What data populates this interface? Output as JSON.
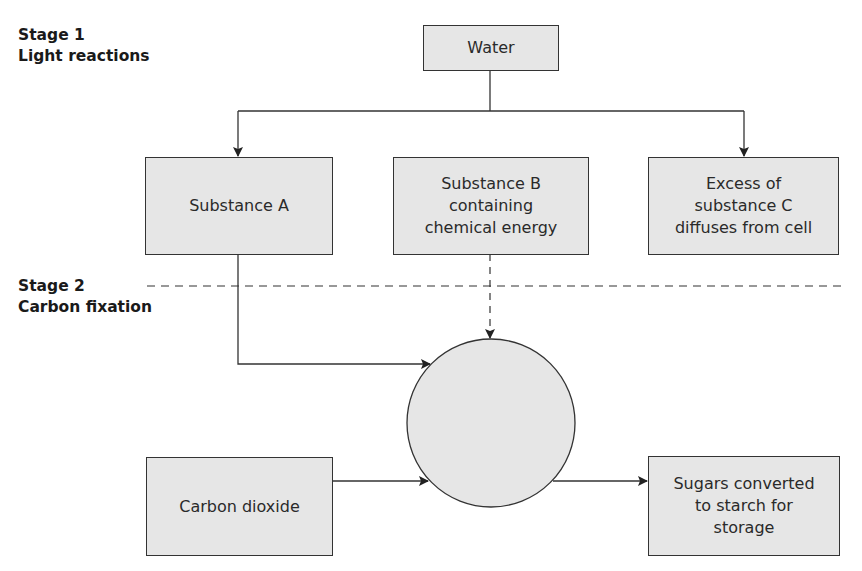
{
  "diagram": {
    "type": "flowchart",
    "topic": "photosynthesis stages",
    "stages": [
      {
        "title": "Stage 1",
        "subtitle": "Light reactions"
      },
      {
        "title": "Stage 2",
        "subtitle": "Carbon fixation"
      }
    ],
    "nodes": {
      "water": {
        "label": "Water"
      },
      "substance_a": {
        "label": "Substance A"
      },
      "substance_b": {
        "line1": "Substance B",
        "line2": "containing",
        "line3": "chemical energy"
      },
      "substance_c": {
        "line1": "Excess of",
        "line2": "substance C",
        "line3": "diffuses from cell"
      },
      "cycle": {
        "label": ""
      },
      "carbon_dioxide": {
        "label": "Carbon dioxide"
      },
      "sugars": {
        "line1": "Sugars converted",
        "line2": "to starch for",
        "line3": "storage"
      }
    },
    "edges": [
      {
        "from": "Water",
        "to": "Substance A",
        "style": "solid"
      },
      {
        "from": "Water",
        "to": "Excess of substance C",
        "style": "solid"
      },
      {
        "from": "Substance A",
        "to": "circle",
        "style": "solid"
      },
      {
        "from": "Substance B",
        "to": "circle",
        "style": "dashed"
      },
      {
        "from": "Carbon dioxide",
        "to": "circle",
        "style": "solid"
      },
      {
        "from": "circle",
        "to": "Sugars converted to starch for storage",
        "style": "solid"
      }
    ],
    "colors": {
      "box_fill": "#e6e6e6",
      "stroke": "#333333"
    }
  }
}
